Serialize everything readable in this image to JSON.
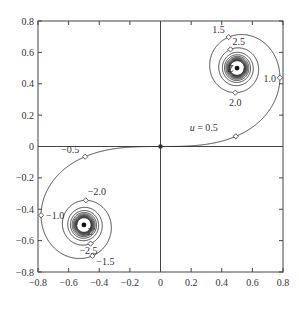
{
  "chart_data": {
    "type": "line",
    "title": "",
    "xlabel": "",
    "ylabel": "",
    "xlim": [
      -0.8,
      0.8
    ],
    "ylim": [
      -0.8,
      0.8
    ],
    "grid": false,
    "x_ticks": [
      "-0.8",
      "-0.6",
      "-0.4",
      "-0.2",
      "0",
      "0.2",
      "0.4",
      "0.6",
      "0.8"
    ],
    "y_ticks": [
      "0.8",
      "0.6",
      "0.4",
      "0.2",
      "0",
      "-0.2",
      "-0.4",
      "-0.6",
      "-0.8"
    ],
    "u_range": [
      -7,
      7
    ],
    "series": [
      {
        "name": "Cornu spiral",
        "color": "#333333"
      }
    ],
    "marked_points": [
      {
        "u": 0.5,
        "label": "u = 0.5",
        "x": 0.492,
        "y": 0.065
      },
      {
        "u": 1.0,
        "label": "1.0",
        "x": 0.78,
        "y": 0.438
      },
      {
        "u": 1.5,
        "label": "1.5",
        "x": 0.445,
        "y": 0.697
      },
      {
        "u": 2.0,
        "label": "2.0",
        "x": 0.488,
        "y": 0.343
      },
      {
        "u": 2.5,
        "label": "2.5",
        "x": 0.457,
        "y": 0.619
      },
      {
        "u": -0.5,
        "label": "-0.5",
        "x": -0.492,
        "y": -0.065
      },
      {
        "u": -1.0,
        "label": "-1.0",
        "x": -0.78,
        "y": -0.438
      },
      {
        "u": -1.5,
        "label": "-1.5",
        "x": -0.445,
        "y": -0.697
      },
      {
        "u": -2.0,
        "label": "-2.0",
        "x": -0.488,
        "y": -0.343
      },
      {
        "u": -2.5,
        "label": "-2.5",
        "x": -0.457,
        "y": -0.619
      }
    ],
    "attractors": [
      {
        "label": "Z",
        "x": 0.5,
        "y": 0.5
      },
      {
        "label": "Z'",
        "x": -0.5,
        "y": -0.5
      }
    ],
    "origin_marker": {
      "x": 0,
      "y": 0
    }
  }
}
